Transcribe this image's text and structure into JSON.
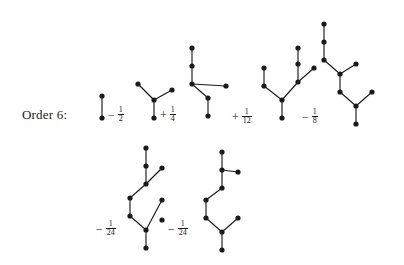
{
  "figure": {
    "order_label": "Order 6:",
    "background": "#ffffff",
    "ink_color": "#1a1a1a"
  },
  "terms": [
    {
      "id": "term-1",
      "sign": "",
      "coefficient": "1",
      "numerator": "",
      "denominator": "",
      "coef_display": "",
      "tree": {
        "name": "single-edge-tree",
        "nodes": [
          [
            10,
            30
          ],
          [
            10,
            8
          ]
        ],
        "edges": [
          [
            0,
            1
          ]
        ]
      },
      "coef_pos": [
        106,
        106
      ],
      "tree_pos": [
        92,
        88
      ]
    },
    {
      "id": "term-2",
      "sign": "−",
      "coefficient": "1/2",
      "numerator": "1",
      "denominator": "2",
      "coef_display": "− 1/2",
      "tree": {
        "name": "cherry-with-stalk-tree",
        "nodes": [
          [
            26,
            42
          ],
          [
            26,
            24
          ],
          [
            10,
            8
          ],
          [
            44,
            14
          ]
        ],
        "edges": [
          [
            0,
            1
          ],
          [
            1,
            2
          ],
          [
            1,
            3
          ]
        ]
      },
      "coef_pos": [
        108,
        106
      ],
      "tree_pos": [
        128,
        76
      ]
    },
    {
      "id": "term-3",
      "sign": "+",
      "coefficient": "1/4",
      "numerator": "1",
      "denominator": "4",
      "coef_display": "+ 1/4",
      "tree": {
        "name": "double-zigzag-tree",
        "nodes": [
          [
            28,
            74
          ],
          [
            28,
            56
          ],
          [
            12,
            42
          ],
          [
            12,
            24
          ],
          [
            12,
            6
          ],
          [
            46,
            44
          ]
        ],
        "edges": [
          [
            0,
            1
          ],
          [
            1,
            2
          ],
          [
            2,
            3
          ],
          [
            3,
            4
          ],
          [
            2,
            5
          ]
        ]
      },
      "coef_pos": [
        160,
        106
      ],
      "tree_pos": [
        180,
        42
      ]
    },
    {
      "id": "term-4",
      "sign": "+",
      "coefficient": "1/12",
      "numerator": "1",
      "denominator": "12",
      "coef_display": "+ 1/12",
      "tree": {
        "name": "branched-fan-tree",
        "nodes": [
          [
            30,
            72
          ],
          [
            30,
            54
          ],
          [
            12,
            40
          ],
          [
            12,
            22
          ],
          [
            46,
            36
          ],
          [
            46,
            18
          ],
          [
            46,
            2
          ],
          [
            62,
            22
          ]
        ],
        "edges": [
          [
            0,
            1
          ],
          [
            1,
            2
          ],
          [
            2,
            3
          ],
          [
            1,
            4
          ],
          [
            4,
            5
          ],
          [
            5,
            6
          ],
          [
            4,
            7
          ]
        ]
      },
      "coef_pos": [
        232,
        108
      ],
      "tree_pos": [
        252,
        46
      ]
    },
    {
      "id": "term-5",
      "sign": "−",
      "coefficient": "1/8",
      "numerator": "1",
      "denominator": "8",
      "coef_display": "− 1/8",
      "tree": {
        "name": "long-zigzag-chain-tree",
        "nodes": [
          [
            44,
            110
          ],
          [
            44,
            92
          ],
          [
            28,
            78
          ],
          [
            28,
            60
          ],
          [
            12,
            46
          ],
          [
            12,
            28
          ],
          [
            12,
            10
          ],
          [
            44,
            50
          ],
          [
            60,
            78
          ]
        ],
        "edges": [
          [
            0,
            1
          ],
          [
            1,
            2
          ],
          [
            2,
            3
          ],
          [
            3,
            4
          ],
          [
            4,
            5
          ],
          [
            5,
            6
          ],
          [
            3,
            7
          ],
          [
            1,
            8
          ]
        ]
      },
      "coef_pos": [
        302,
        108
      ],
      "tree_pos": [
        312,
        14
      ]
    },
    {
      "id": "term-6",
      "sign": "−",
      "coefficient": "1/24",
      "numerator": "1",
      "denominator": "24",
      "coef_display": "− 1/24",
      "tree": {
        "name": "tall-branched-tree-a",
        "nodes": [
          [
            30,
            100
          ],
          [
            30,
            82
          ],
          [
            14,
            68
          ],
          [
            14,
            50
          ],
          [
            30,
            36
          ],
          [
            30,
            18
          ],
          [
            30,
            0
          ],
          [
            46,
            20
          ],
          [
            46,
            52
          ],
          [
            46,
            72
          ]
        ],
        "edges": [
          [
            0,
            1
          ],
          [
            1,
            2
          ],
          [
            2,
            3
          ],
          [
            3,
            4
          ],
          [
            4,
            5
          ],
          [
            5,
            6
          ],
          [
            4,
            7
          ],
          [
            1,
            8
          ]
        ]
      },
      "coef_pos": [
        96,
        220
      ],
      "tree_pos": [
        116,
        148
      ]
    },
    {
      "id": "term-7",
      "sign": "−",
      "coefficient": "1/24",
      "numerator": "1",
      "denominator": "24",
      "coef_display": "− 1/24",
      "tree": {
        "name": "tall-branched-tree-b",
        "nodes": [
          [
            30,
            104
          ],
          [
            30,
            86
          ],
          [
            14,
            72
          ],
          [
            14,
            54
          ],
          [
            30,
            42
          ],
          [
            30,
            24
          ],
          [
            30,
            6
          ],
          [
            46,
            26
          ],
          [
            46,
            72
          ]
        ],
        "edges": [
          [
            0,
            1
          ],
          [
            1,
            2
          ],
          [
            2,
            3
          ],
          [
            3,
            4
          ],
          [
            4,
            5
          ],
          [
            5,
            6
          ],
          [
            5,
            7
          ],
          [
            1,
            8
          ]
        ]
      },
      "coef_pos": [
        168,
        220
      ],
      "tree_pos": [
        192,
        146
      ]
    }
  ]
}
